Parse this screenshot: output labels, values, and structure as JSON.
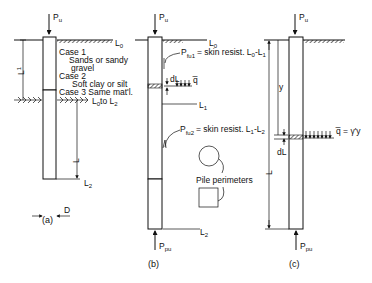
{
  "figure": {
    "panels": [
      {
        "id": "a",
        "caption": "(a)",
        "load_top": "P",
        "load_top_sub": "u",
        "level_top": "L",
        "level_top_sub": "0",
        "level_bottom": "L",
        "level_bottom_sub": "2",
        "dim_upper": "L",
        "dim_upper_sup": "1",
        "dim_lower": "L",
        "diameter": "D",
        "cases": [
          {
            "title": "Case 1",
            "desc": "Sands or sandy",
            "desc2": "gravel"
          },
          {
            "title": "Case 2",
            "desc": "Soft clay or silt"
          },
          {
            "title": "Case 3",
            "desc": "Same mat'l.",
            "desc2": "L",
            "desc2_sub": "0",
            "desc2_mid": "to L",
            "desc2_sub2": "2"
          }
        ]
      },
      {
        "id": "b",
        "caption": "(b)",
        "load_top": "P",
        "load_top_sub": "u",
        "load_bottom": "P",
        "load_bottom_sub": "pu",
        "level_top": "L",
        "level_top_sub": "0",
        "level_mid": "L",
        "level_mid_sub": "1",
        "level_bottom": "L",
        "level_bottom_sub": "2",
        "element": "dL",
        "pressure": "q̅",
        "skin1": {
          "sym": "P",
          "sub": "fu1",
          "text": "= skin resist. L",
          "a_sub": "0",
          "dash": "-L",
          "b_sub": "1"
        },
        "skin2": {
          "sym": "P",
          "sub": "fu2",
          "text": "= skin resist. L",
          "a_sub": "1",
          "dash": "-L",
          "b_sub": "2"
        },
        "perimeter_label": "Pile perimeters"
      },
      {
        "id": "c",
        "caption": "(c)",
        "load_top": "P",
        "load_top_sub": "u",
        "load_bottom": "P",
        "load_bottom_sub": "pu",
        "depth": "y",
        "element": "dL",
        "length": "L",
        "pressure": "q̅ = γ'y"
      }
    ]
  }
}
